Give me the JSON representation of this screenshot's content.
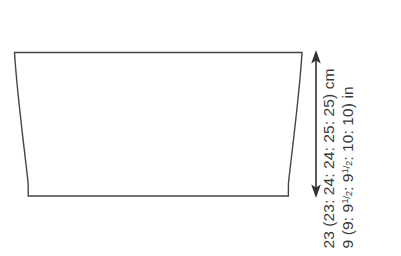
{
  "diagram": {
    "shape": {
      "name": "trapezoid-panel",
      "description": "tapered panel, wider at top than at bottom"
    },
    "colors": {
      "outline": "#444444",
      "arrow": "#333333",
      "text": "#3b3b3b",
      "background": "#ffffff"
    }
  },
  "measurements": {
    "height": {
      "cm_line": "23 (23: 24: 24: 25: 25) cm",
      "in_line_prefix": "9 (9: ",
      "in_line_mid": ": ",
      "in_line_suffix": ": 10: 10) in",
      "cm_values": [
        "23",
        "23",
        "24",
        "24",
        "25",
        "25"
      ],
      "cm_unit": "cm",
      "in_values": [
        "9",
        "9",
        "9 1/2",
        "9 1/2",
        "10",
        "10"
      ],
      "in_unit": "in",
      "frac_numerator": "1",
      "frac_slash": "/",
      "frac_denominator": "2",
      "in_whole_a": "9",
      "in_whole_b": "9"
    }
  },
  "annotations": {
    "arrow_name": "height-dimension-arrow",
    "arrow_style": "double-headed vertical"
  }
}
